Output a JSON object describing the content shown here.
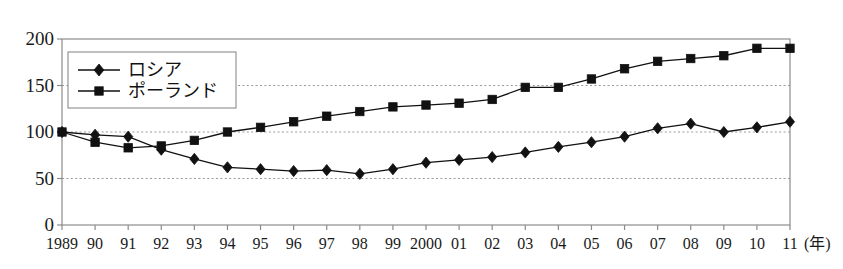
{
  "chart_data": {
    "type": "line",
    "title": "",
    "subtitle": "",
    "xlabel": "(年)",
    "ylabel": "",
    "xlim": [
      1989,
      2011
    ],
    "ylim": [
      0,
      200
    ],
    "grid": true,
    "grid_axis": "y",
    "grid_style": "dotted",
    "legend_position": "top-left-inside",
    "x": [
      1989,
      1990,
      1991,
      1992,
      1993,
      1994,
      1995,
      1996,
      1997,
      1998,
      1999,
      2000,
      2001,
      2002,
      2003,
      2004,
      2005,
      2006,
      2007,
      2008,
      2009,
      2010,
      2011
    ],
    "categories": [
      "1989",
      "90",
      "91",
      "92",
      "93",
      "94",
      "95",
      "96",
      "97",
      "98",
      "99",
      "2000",
      "01",
      "02",
      "03",
      "04",
      "05",
      "06",
      "07",
      "08",
      "09",
      "10",
      "11"
    ],
    "ytick_labels": [
      "0",
      "50",
      "100",
      "150",
      "200"
    ],
    "ytick_values": [
      0,
      50,
      100,
      150,
      200
    ],
    "series": [
      {
        "name": "ロシア",
        "marker": "diamond",
        "color": "#111111",
        "values": [
          100,
          97,
          95,
          81,
          71,
          62,
          60,
          58,
          59,
          55,
          60,
          67,
          70,
          73,
          78,
          84,
          89,
          95,
          104,
          109,
          100,
          105,
          111
        ]
      },
      {
        "name": "ポーランド",
        "marker": "square",
        "color": "#111111",
        "values": [
          100,
          89,
          83,
          85,
          91,
          100,
          105,
          111,
          117,
          122,
          127,
          129,
          131,
          135,
          148,
          148,
          157,
          168,
          176,
          179,
          182,
          190,
          190
        ]
      }
    ]
  },
  "legend": {
    "items": [
      {
        "label": "ロシア",
        "marker": "diamond"
      },
      {
        "label": "ポーランド",
        "marker": "square"
      }
    ]
  },
  "axes": {
    "x_unit": "(年)"
  },
  "colors": {
    "line": "#111111",
    "frame": "#8c8c8c",
    "grid": "#9a9a9a",
    "text": "#1a1a1a",
    "background": "#ffffff"
  }
}
